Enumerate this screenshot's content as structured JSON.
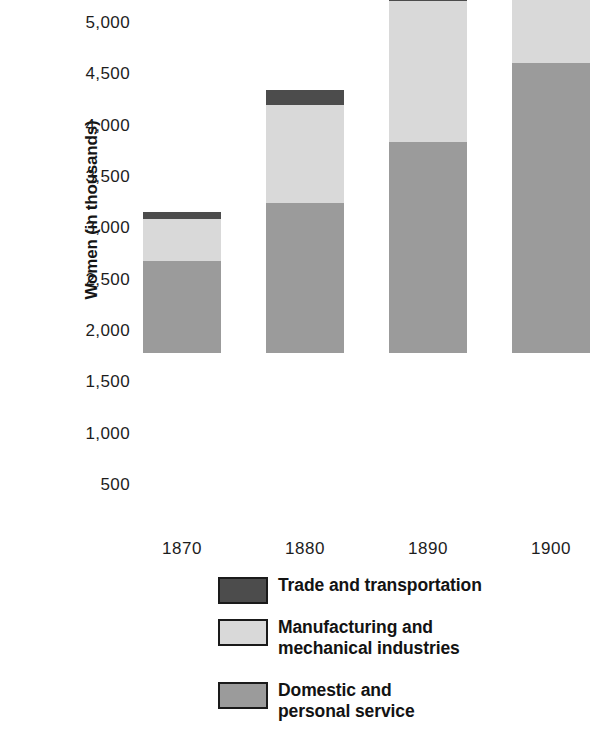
{
  "chart_data": {
    "type": "bar",
    "subtype": "stacked-vertical",
    "title": "",
    "xlabel": "",
    "ylabel": "Women (in thousands)",
    "categories": [
      "1870",
      "1880",
      "1890",
      "1900"
    ],
    "ylim": [
      0,
      5000
    ],
    "y_ticks": [
      "500",
      "1,000",
      "1,500",
      "2,000",
      "2,500",
      "3,000",
      "3,500",
      "4,000",
      "4,500",
      "5,000"
    ],
    "y_tick_values": [
      500,
      1000,
      1500,
      2000,
      2500,
      3000,
      3500,
      4000,
      4500,
      5000
    ],
    "grid": false,
    "legend_position": "bottom-left",
    "stack_order_bottom_to_top": [
      "Domestic and personal service",
      "Manufacturing and mechanical industries",
      "Trade and transportation"
    ],
    "series": [
      {
        "name": "Domestic and personal service",
        "color": "#9b9b9b",
        "values": [
          900,
          1460,
          2060,
          2825
        ]
      },
      {
        "name": "Manufacturing and mechanical industries",
        "color": "#d9d9d9",
        "values": [
          410,
          955,
          1375,
          1445
        ]
      },
      {
        "name": "Trade and transportation",
        "color": "#4c4c4c",
        "values": [
          70,
          145,
          300,
          760
        ]
      }
    ],
    "totals": [
      1380,
      2560,
      3735,
      5030
    ]
  },
  "axis": {
    "y_title": "Women (in thousands)",
    "y_tick_labels": [
      "5,000",
      "4,500",
      "4,000",
      "3,500",
      "3,000",
      "2,500",
      "2,000",
      "1,500",
      "1,000",
      "500"
    ],
    "x_tick_labels": [
      "1870",
      "1880",
      "1890",
      "1900"
    ]
  },
  "legend": {
    "items": [
      {
        "label": "Trade and transportation",
        "color": "#4c4c4c"
      },
      {
        "label": "Manufacturing and\nmechanical industries",
        "color": "#d9d9d9"
      },
      {
        "label": "Domestic and\npersonal service",
        "color": "#9b9b9b"
      }
    ]
  },
  "colors": {
    "trade": "#4c4c4c",
    "manufacturing": "#d9d9d9",
    "domestic": "#9b9b9b",
    "background": "#ffffff",
    "text": "#1a1a1a"
  }
}
